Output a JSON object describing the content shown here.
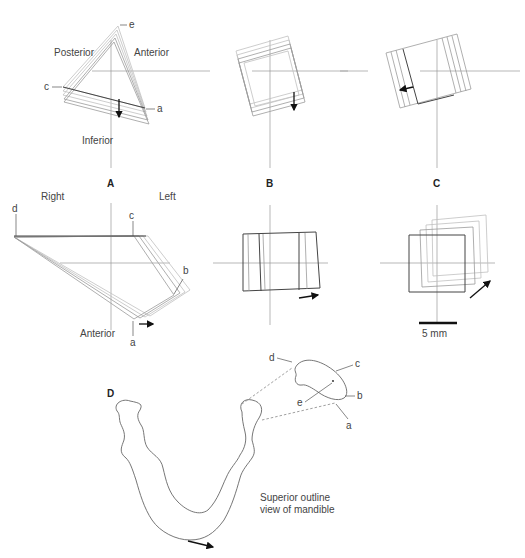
{
  "figure": {
    "panels": {
      "A": {
        "label": "A",
        "top": {
          "labels": {
            "posterior": "Posterior",
            "anterior": "Anterior",
            "inferior": "Inferior",
            "point_e": "e",
            "point_c": "c",
            "point_a": "a"
          }
        },
        "bottom": {
          "labels": {
            "right": "Right",
            "left": "Left",
            "anterior": "Anterior",
            "point_d": "d",
            "point_c": "c",
            "point_b": "b",
            "point_a": "a"
          }
        }
      },
      "B": {
        "label": "B"
      },
      "C": {
        "label": "C",
        "scale_bar": {
          "label": "5 mm"
        }
      },
      "D": {
        "label": "D",
        "caption_line1": "Superior outline",
        "caption_line2": "view of mandible",
        "condyle_points": {
          "d": "d",
          "c": "c",
          "b": "b",
          "e": "e",
          "a": "a"
        }
      }
    },
    "icons": [
      "arrow-down-icon",
      "arrow-left-icon",
      "arrow-right-icon",
      "arrow-diagonal-icon"
    ]
  }
}
